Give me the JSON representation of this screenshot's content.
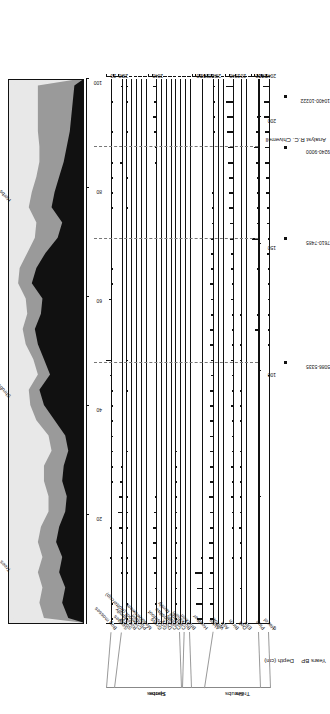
{
  "figure": {
    "kind": "pollen-percentage-diagram",
    "analyst_label": "Analyst  R.C. Chiverrell",
    "depth_axis_title": "Depth (cm)",
    "years_axis_title": "Years BP",
    "orientation_note": "landscape figure rotated 90 degrees in the screenshot"
  },
  "groups": [
    {
      "name": "Trees"
    },
    {
      "name": "Shrubs"
    },
    {
      "name": "Herbs"
    },
    {
      "name": "Spores"
    }
  ],
  "depth_axis": {
    "title": "Depth (cm)",
    "ticks": [
      0,
      50,
      100,
      150,
      200
    ],
    "labelled_ticks": [
      "0",
      "100",
      "150",
      "200"
    ],
    "min": 0,
    "max": 215
  },
  "radiocarbon_dates": [
    {
      "label": "5086-5335",
      "depth": 103
    },
    {
      "label": "7610-7485",
      "depth": 152
    },
    {
      "label": "9240-9000",
      "depth": 188
    },
    {
      "label": "10400-10222",
      "depth": 208
    }
  ],
  "summary_panel": {
    "title": "",
    "axis_ticks": [
      20,
      40,
      60,
      80,
      100
    ],
    "legend": [
      "Trees",
      "Shrubs",
      "Herbs"
    ],
    "colors": {
      "trees": "#111111",
      "shrubs": "#9a9a9a",
      "herbs": "#e8e8e8"
    }
  },
  "chart_data": {
    "type": "area",
    "xlabel": "Depth (cm)",
    "ylabel": "Percentage",
    "grid": false,
    "legend_position": "top",
    "x": [
      2,
      8,
      14,
      20,
      26,
      32,
      38,
      44,
      50,
      56,
      62,
      68,
      74,
      80,
      86,
      92,
      98,
      104,
      110,
      116,
      122,
      128,
      134,
      140,
      146,
      152,
      158,
      164,
      170,
      176,
      182,
      188,
      194,
      200,
      206,
      212
    ],
    "summary": {
      "type": "area",
      "stacked": true,
      "ylim": [
        0,
        100
      ],
      "yticks": [
        20,
        40,
        60,
        80,
        100
      ],
      "series": [
        {
          "name": "Trees",
          "color": "#111111",
          "values": [
            22,
            30,
            26,
            34,
            30,
            38,
            34,
            26,
            24,
            30,
            28,
            22,
            26,
            40,
            54,
            60,
            46,
            54,
            62,
            66,
            58,
            56,
            70,
            64,
            52,
            36,
            30,
            44,
            40,
            34,
            28,
            24,
            20,
            18,
            16,
            14
          ]
        },
        {
          "name": "Shrubs",
          "color": "#9a9a9a",
          "values": [
            32,
            30,
            30,
            28,
            26,
            24,
            24,
            22,
            24,
            24,
            26,
            22,
            22,
            24,
            18,
            14,
            16,
            14,
            16,
            16,
            18,
            22,
            18,
            22,
            24,
            30,
            34,
            30,
            30,
            30,
            32,
            36,
            42,
            44,
            46,
            48
          ]
        },
        {
          "name": "Herbs",
          "color": "#e8e8e8",
          "values": [
            46,
            40,
            44,
            38,
            44,
            38,
            42,
            52,
            52,
            46,
            46,
            56,
            52,
            36,
            28,
            26,
            38,
            32,
            22,
            18,
            24,
            22,
            12,
            14,
            24,
            34,
            36,
            26,
            30,
            36,
            40,
            40,
            38,
            38,
            38,
            38
          ]
        }
      ]
    },
    "taxa": [
      {
        "name": "Bog mosses",
        "group": "Spores",
        "xmax": 20,
        "xticks": [
          20
        ],
        "values": [
          3,
          2,
          6,
          5,
          9,
          6,
          7,
          6,
          4,
          2,
          1,
          1,
          0.5,
          0.5,
          1,
          2,
          9,
          21,
          6,
          5,
          0,
          10,
          1,
          1,
          0,
          0,
          0,
          1,
          1,
          2,
          1,
          0,
          3,
          0,
          2,
          4
        ]
      },
      {
        "name": "Sedges",
        "group": "Herbs",
        "xmax": 40,
        "xticks": [
          20,
          40
        ],
        "values": [
          4,
          3,
          5,
          6,
          7,
          9,
          14,
          21,
          16,
          13,
          9,
          5,
          2,
          1,
          5,
          2,
          1,
          1,
          0.5,
          3,
          4,
          1,
          1,
          1,
          1,
          1,
          1,
          1,
          1,
          1,
          12,
          0.5,
          1,
          2,
          4,
          6
        ]
      },
      {
        "name": "Sorrel",
        "group": "Herbs",
        "xmax": 10,
        "xticks": [],
        "values": [
          1,
          1,
          0,
          2,
          1,
          0,
          0.5,
          0.5,
          0.5,
          0,
          0,
          1,
          0,
          0,
          0,
          1,
          0,
          1,
          0,
          0,
          0,
          0,
          0,
          0,
          0,
          0,
          0,
          1,
          0,
          1,
          0,
          0,
          1,
          0,
          1,
          1
        ]
      },
      {
        "name": "Rose family",
        "group": "Herbs",
        "xmax": 10,
        "xticks": [],
        "values": [
          0,
          0,
          0,
          0,
          0,
          0,
          0,
          1,
          0.5,
          0,
          0,
          0.5,
          0,
          0,
          0,
          0,
          0,
          0,
          1,
          0,
          0,
          0.5,
          0,
          0.5,
          0.5,
          0,
          0,
          0.5,
          0.5,
          0.5,
          0.5,
          0,
          0.5,
          0.5,
          0.5,
          0
        ]
      },
      {
        "name": "Crowfoot (Buttercup)",
        "group": "Herbs",
        "xmax": 10,
        "xticks": [],
        "values": [
          1,
          1,
          0.5,
          1,
          0,
          0,
          0,
          2,
          0.5,
          0,
          0,
          0,
          0.5,
          0,
          0,
          0,
          0,
          0,
          0,
          0.5,
          0.5,
          0,
          0,
          0,
          0,
          0.5,
          0,
          0,
          0.5,
          0.5,
          0.5,
          0,
          0.5,
          0.5,
          1,
          0.5
        ]
      },
      {
        "name": "Plantain",
        "group": "Herbs",
        "xmax": 10,
        "xticks": [],
        "values": [
          1,
          1,
          1,
          2,
          0.5,
          0.5,
          1,
          1,
          1,
          0.5,
          0.5,
          0.5,
          0,
          0,
          0,
          0,
          0,
          0,
          0,
          0,
          0,
          0,
          0,
          0,
          0,
          0,
          0,
          0,
          0,
          0,
          0,
          0,
          0,
          0,
          0,
          0
        ]
      },
      {
        "name": "Meadowsweet",
        "group": "Herbs",
        "xmax": 10,
        "xticks": [],
        "values": [
          1,
          1,
          1,
          1,
          2,
          1,
          1,
          1,
          2,
          1,
          1,
          1,
          1,
          0.5,
          0.5,
          0.5,
          0.5,
          0.5,
          0,
          0,
          0,
          0.5,
          0,
          0,
          0.5,
          1,
          0,
          0.5,
          0.5,
          0.5,
          0.5,
          0.5,
          1,
          1,
          2,
          2
        ]
      },
      {
        "name": "Grass",
        "group": "Herbs",
        "xmax": 40,
        "xticks": [
          20,
          40
        ],
        "values": [
          5,
          7,
          11,
          13,
          16,
          19,
          16,
          13,
          9,
          6,
          4,
          3,
          2,
          2,
          1,
          1,
          1,
          2,
          2,
          1,
          1,
          1,
          1,
          1,
          1,
          1,
          1,
          2,
          2,
          6,
          9,
          11,
          13,
          16,
          14,
          18
        ]
      },
      {
        "name": "Goosefoot",
        "group": "Herbs",
        "xmax": 10,
        "xticks": [],
        "values": [
          0,
          1,
          0.5,
          0,
          0,
          0,
          0.5,
          0.5,
          0,
          0,
          0,
          0,
          0,
          0,
          0,
          0,
          0,
          0,
          0,
          0,
          0,
          0,
          0,
          0,
          0,
          0,
          0,
          0,
          0,
          0,
          0,
          0.5,
          0.5,
          0.5,
          1,
          1
        ]
      },
      {
        "name": "Dock",
        "group": "Herbs",
        "xmax": 10,
        "xticks": [],
        "values": [
          1,
          0.5,
          0,
          0.5,
          0,
          0,
          0,
          0,
          0,
          0,
          0,
          0,
          0,
          0,
          0,
          0,
          0,
          0,
          0,
          0,
          0,
          0,
          0,
          0,
          0,
          0,
          0,
          0,
          0,
          0,
          0,
          0,
          0,
          0,
          0,
          0
        ]
      },
      {
        "name": "Compositae",
        "group": "Herbs",
        "xmax": 10,
        "xticks": [],
        "values": [
          1,
          1,
          0.5,
          1,
          1,
          0.5,
          1,
          0.5,
          1,
          0.5,
          0.5,
          0.5,
          0.5,
          0.5,
          0.5,
          0.5,
          0.5,
          1,
          0.5,
          0.5,
          0.5,
          0.5,
          0.5,
          0.5,
          0.5,
          0.5,
          0.5,
          0.5,
          0.5,
          0.5,
          0.5,
          0.5,
          1,
          1,
          1,
          1
        ]
      },
      {
        "name": "Cereals",
        "group": "Herbs",
        "xmax": 10,
        "xticks": [],
        "values": [
          1,
          0.5,
          1,
          0.5,
          1,
          2,
          1,
          0.5,
          1,
          0.5,
          0.5,
          0.5,
          0,
          0,
          0,
          0,
          0,
          0,
          0,
          0,
          0,
          0,
          0,
          0,
          0,
          0,
          0,
          0,
          0,
          0,
          0,
          0,
          0,
          0,
          0,
          0
        ]
      },
      {
        "name": "Cabbage family",
        "group": "Herbs",
        "xmax": 10,
        "xticks": [],
        "values": [
          0,
          0,
          0.5,
          0,
          0.5,
          0,
          0,
          0,
          0,
          0,
          0,
          0,
          0,
          0,
          0,
          0,
          0,
          0,
          0,
          0,
          0,
          0,
          0,
          0,
          0,
          0,
          0,
          0,
          0,
          0,
          0,
          0,
          0,
          0,
          0,
          0
        ]
      },
      {
        "name": "Buckthorn",
        "group": "Shrubs",
        "xmax": 10,
        "xticks": [],
        "values": [
          0,
          0,
          0,
          0,
          0,
          0,
          0,
          0,
          0.5,
          0.5,
          0,
          0,
          0,
          0,
          0.5,
          0,
          0.5,
          0,
          0,
          0,
          0,
          0,
          0,
          0,
          0,
          0,
          0,
          0,
          0,
          0,
          0,
          0,
          0,
          0,
          0,
          0
        ]
      },
      {
        "name": "Bracken",
        "group": "Spores",
        "xmax": 10,
        "xticks": [],
        "values": [
          0.5,
          0.5,
          0.5,
          0,
          0.5,
          0,
          0.5,
          0,
          0.5,
          0,
          0,
          0,
          0,
          0,
          0.5,
          0,
          0.5,
          0,
          0,
          0,
          0.5,
          0,
          0,
          0,
          0,
          0,
          0,
          0,
          0,
          0,
          0,
          0,
          0,
          0,
          0,
          0
        ]
      },
      {
        "name": "Heather",
        "group": "Shrubs",
        "xmax": 60,
        "xticks": [
          20,
          40,
          60
        ],
        "values": [
          30,
          36,
          34,
          42,
          12,
          6,
          3,
          2,
          1,
          1,
          1,
          1,
          1,
          1,
          1,
          1,
          1,
          1,
          1,
          1,
          1,
          1,
          1,
          1,
          1,
          1,
          1,
          1,
          1,
          1,
          1,
          1,
          1,
          1,
          1,
          1
        ]
      },
      {
        "name": "Alder",
        "group": "Trees",
        "xmax": 60,
        "xticks": [
          20,
          40,
          60
        ],
        "values": [
          26,
          24,
          29,
          28,
          32,
          30,
          28,
          26,
          30,
          28,
          26,
          24,
          26,
          28,
          26,
          24,
          22,
          20,
          24,
          28,
          22,
          20,
          24,
          22,
          20,
          18,
          16,
          14,
          12,
          10,
          8,
          6,
          4,
          3,
          2,
          1
        ]
      },
      {
        "name": "Willow",
        "group": "Trees",
        "xmax": 10,
        "xticks": [],
        "values": [
          0.5,
          0.5,
          0,
          0,
          0.5,
          0,
          0,
          0,
          0,
          0,
          0,
          0,
          0,
          0,
          0,
          0,
          0,
          0,
          0,
          0,
          0,
          0,
          0,
          0,
          0,
          0,
          0,
          0,
          0,
          0,
          0,
          0,
          0,
          0,
          0,
          0
        ]
      },
      {
        "name": "Ash",
        "group": "Trees",
        "xmax": 10,
        "xticks": [],
        "values": [
          1,
          1,
          0,
          0,
          0,
          0.5,
          1,
          0.5,
          0,
          0,
          0.5,
          0.5,
          0,
          0,
          0,
          0,
          0,
          0,
          0,
          0,
          0,
          0,
          0,
          0,
          0,
          0,
          0,
          0,
          0,
          0,
          0,
          0,
          0,
          0,
          0,
          0
        ]
      },
      {
        "name": "Birch",
        "group": "Trees",
        "xmax": 40,
        "xticks": [
          20,
          40
        ],
        "values": [
          6,
          4,
          8,
          5,
          9,
          6,
          11,
          9,
          13,
          10,
          14,
          12,
          9,
          11,
          14,
          12,
          10,
          13,
          9,
          11,
          9,
          13,
          11,
          14,
          16,
          18,
          20,
          22,
          24,
          26,
          28,
          30,
          32,
          34,
          36,
          38
        ]
      },
      {
        "name": "Oak",
        "group": "Trees",
        "xmax": 20,
        "xticks": [
          20
        ],
        "values": [
          4,
          3,
          6,
          4,
          7,
          5,
          8,
          6,
          5,
          7,
          5,
          6,
          4,
          5,
          7,
          6,
          4,
          5,
          6,
          4,
          5,
          4,
          3,
          4,
          3,
          2,
          2,
          1,
          1,
          1,
          1,
          0.5,
          0.5,
          0.5,
          0.5,
          0.5
        ]
      },
      {
        "name": "Elm",
        "group": "Trees",
        "xmax": 10,
        "xticks": [],
        "values": [
          0.5,
          0.5,
          0.5,
          1,
          0.5,
          0.5,
          0.5,
          1,
          0.5,
          0.5,
          0.5,
          0.5,
          0.5,
          0.5,
          0.5,
          0.5,
          0.5,
          0.5,
          0.5,
          0.5,
          0.5,
          0.5,
          0.5,
          0.5,
          0.5,
          0.5,
          0.5,
          0.5,
          0.5,
          0.5,
          0.5,
          0.5,
          0.5,
          0.5,
          0.5,
          0.5
        ]
      },
      {
        "name": "Pine",
        "group": "Trees",
        "xmax": 80,
        "xticks": [
          20,
          40,
          60
        ],
        "values": [
          1,
          1,
          1,
          2,
          1,
          1,
          2,
          1,
          2,
          6,
          8,
          7,
          9,
          8,
          10,
          9,
          12,
          10,
          14,
          34,
          22,
          16,
          18,
          20,
          14,
          56,
          22,
          20,
          24,
          22,
          26,
          38,
          30,
          22,
          16,
          12
        ]
      },
      {
        "name": "Hazel",
        "group": "Shrubs",
        "xmax": 40,
        "xticks": [
          20,
          40
        ],
        "values": [
          4,
          3,
          5,
          4,
          6,
          5,
          7,
          6,
          5,
          7,
          6,
          8,
          7,
          6,
          8,
          7,
          9,
          8,
          10,
          9,
          11,
          10,
          12,
          11,
          13,
          12,
          14,
          16,
          18,
          20,
          22,
          24,
          26,
          28,
          30,
          34
        ]
      }
    ]
  }
}
